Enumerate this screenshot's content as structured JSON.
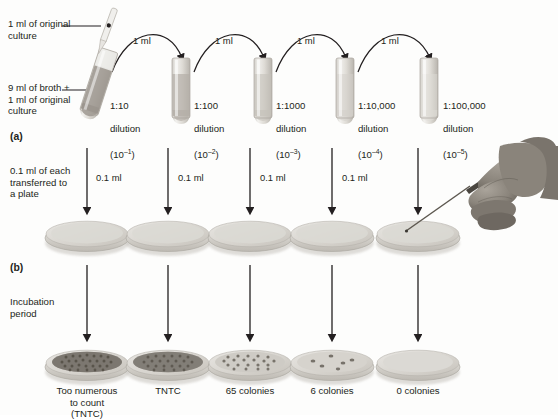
{
  "figure": {
    "panels": [
      {
        "id": "a",
        "label": "(a)"
      },
      {
        "id": "b",
        "label": "(b)"
      }
    ]
  },
  "annotations": {
    "original_culture": "1 ml of original\nculture",
    "broth_plus_culture": "9 ml of broth +\n1 ml of original\nculture",
    "transfer_note": "0.1 ml of each\ntransferred to\na plate",
    "incubation_note": "Incubation\nperiod"
  },
  "transfer_volume": "1 ml",
  "plate_volume": "0.1 ml",
  "tubes": [
    {
      "ratio": "1:10",
      "dilution_word": "dilution",
      "exponent_base": "(10",
      "exponent": "–1",
      "exponent_close": ")",
      "turbidity": "#9a948c"
    },
    {
      "ratio": "1:100",
      "dilution_word": "dilution",
      "exponent_base": "(10",
      "exponent": "–2",
      "exponent_close": ")",
      "turbidity": "#b3aea6"
    },
    {
      "ratio": "1:1000",
      "dilution_word": "dilution",
      "exponent_base": "(10",
      "exponent": "–3",
      "exponent_close": ")",
      "turbidity": "#c5c1ba"
    },
    {
      "ratio": "1:10,000",
      "dilution_word": "dilution",
      "exponent_base": "(10",
      "exponent": "–4",
      "exponent_close": ")",
      "turbidity": "#d3d0ca"
    },
    {
      "ratio": "1:100,000",
      "dilution_word": "dilution",
      "exponent_base": "(10",
      "exponent": "–5",
      "exponent_close": ")",
      "turbidity": "#dedbd6"
    }
  ],
  "arc_labels": [
    "1 ml",
    "1 ml",
    "1 ml",
    "1 ml"
  ],
  "drop_labels": [
    "0.1 ml",
    "0.1 ml",
    "0.1 ml",
    "0.1 ml"
  ],
  "results": [
    {
      "label": "Too numerous\nto count\n(TNTC)",
      "colonies": "TNTC",
      "count": 300
    },
    {
      "label": "TNTC",
      "colonies": "TNTC",
      "count": 200
    },
    {
      "label": "65 colonies",
      "colonies": "65",
      "count": 65
    },
    {
      "label": "6 colonies",
      "colonies": "6",
      "count": 6
    },
    {
      "label": "0 colonies",
      "colonies": "0",
      "count": 0
    }
  ],
  "colors": {
    "ink": "#231f20",
    "plate_rim": "#c9c6bf",
    "plate_top": "#d9d7d1",
    "colony": "#6f6a63",
    "hand": "#8d8880",
    "glass": "#e6e4df"
  }
}
